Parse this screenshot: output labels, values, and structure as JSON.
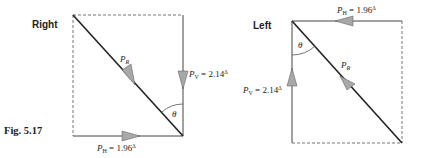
{
  "figure": {
    "caption": "Fig. 5.17"
  },
  "diagrams": [
    {
      "title": "Right",
      "resultant_label": "P",
      "resultant_sub": "R",
      "vertical_label": "P",
      "vertical_sub": "V",
      "vertical_value": " = 2.14",
      "horizontal_label": "P",
      "horizontal_sub": "H",
      "horizontal_value": " = 1.96",
      "prism_symbol": "Δ",
      "angle_label": "θ"
    },
    {
      "title": "Left",
      "resultant_label": "P",
      "resultant_sub": "R",
      "vertical_label": "P",
      "vertical_sub": "V",
      "vertical_value": " = 2.14",
      "horizontal_label": "P",
      "horizontal_sub": "H",
      "horizontal_value": " = 1.96",
      "prism_symbol": "Δ",
      "angle_label": "θ"
    }
  ],
  "colors": {
    "line": "#222222",
    "arrow_fill": "#a8a8a8",
    "dashed": "#666666"
  }
}
